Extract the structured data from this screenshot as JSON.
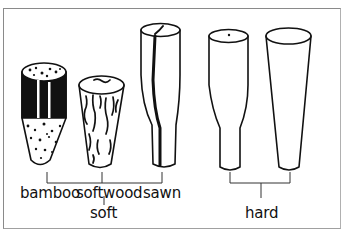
{
  "figure": {
    "labels": {
      "bamboo": "bamboo",
      "softwood": "softwood",
      "sawn": "sawn",
      "soft": "soft",
      "hard": "hard"
    },
    "groups": [
      {
        "name": "soft",
        "members": [
          "bamboo",
          "softwood",
          "sawn"
        ]
      },
      {
        "name": "hard",
        "members": [
          "hard peg 1",
          "hard peg 2"
        ]
      }
    ],
    "colors": {
      "ink": "#111111",
      "frame": "#8a8a8a",
      "background": "#ffffff"
    }
  }
}
